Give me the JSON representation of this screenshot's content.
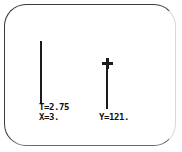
{
  "screen": {
    "frame_color": "#3a3a3a",
    "background_color": "#ffffff"
  },
  "plot": {
    "ink_color": "#1b1b1b",
    "marks": [
      {
        "name": "left-bar",
        "has_cross_cap": false
      },
      {
        "name": "right-bar",
        "has_cross_cap": true,
        "cap_glyph": "plus-marker"
      }
    ]
  },
  "readouts": {
    "t_label": "T=2.75",
    "x_label": "X=3.",
    "y_label": "Y=121."
  }
}
